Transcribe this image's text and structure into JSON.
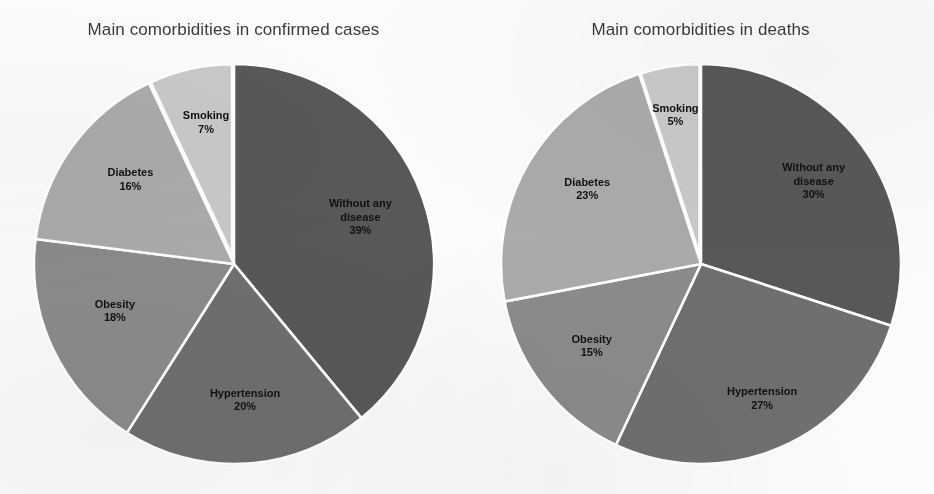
{
  "chart_data": [
    {
      "type": "pie",
      "title": "Main comorbidities in confirmed cases",
      "categories": [
        "Without any disease",
        "Hypertension",
        "Obesity",
        "Diabetes",
        "Smoking"
      ],
      "values": [
        39,
        20,
        18,
        16,
        7
      ],
      "value_labels": [
        "39%",
        "20%",
        "18%",
        "16%",
        "7%"
      ],
      "unit": "%",
      "start_angle_deg": 0,
      "direction": "clockwise",
      "exploded_slices": [
        "Smoking"
      ],
      "legend": "none",
      "labels_position": "inside-and-on-slice",
      "colors": [
        "#585858",
        "#6f6f6f",
        "#8b8b8b",
        "#ababab",
        "#c9c9c9"
      ],
      "slice_separator_color": "#ffffff"
    },
    {
      "type": "pie",
      "title": "Main comorbidities in deaths",
      "categories": [
        "Without any disease",
        "Hypertension",
        "Obesity",
        "Diabetes",
        "Smoking"
      ],
      "values": [
        30,
        27,
        15,
        23,
        5
      ],
      "value_labels": [
        "30%",
        "27%",
        "15%",
        "23%",
        "5%"
      ],
      "unit": "%",
      "start_angle_deg": 0,
      "direction": "clockwise",
      "exploded_slices": [
        "Smoking"
      ],
      "legend": "none",
      "labels_position": "inside-and-on-slice",
      "colors": [
        "#585858",
        "#6f6f6f",
        "#8b8b8b",
        "#ababab",
        "#c9c9c9"
      ],
      "slice_separator_color": "#ffffff"
    }
  ],
  "panels": {
    "left": {
      "title": "Main comorbidities in confirmed cases",
      "slices": [
        {
          "name": "Without any disease",
          "value": 39,
          "value_label": "39%",
          "color": "#585858"
        },
        {
          "name": "Hypertension",
          "value": 20,
          "value_label": "20%",
          "color": "#6f6f6f"
        },
        {
          "name": "Obesity",
          "value": 18,
          "value_label": "18%",
          "color": "#8b8b8b"
        },
        {
          "name": "Diabetes",
          "value": 16,
          "value_label": "16%",
          "color": "#ababab"
        },
        {
          "name": "Smoking",
          "value": 7,
          "value_label": "7%",
          "color": "#c9c9c9"
        }
      ]
    },
    "right": {
      "title": "Main comorbidities in deaths",
      "slices": [
        {
          "name": "Without any disease",
          "value": 30,
          "value_label": "30%",
          "color": "#585858"
        },
        {
          "name": "Hypertension",
          "value": 27,
          "value_label": "27%",
          "color": "#6f6f6f"
        },
        {
          "name": "Obesity",
          "value": 15,
          "value_label": "15%",
          "color": "#8b8b8b"
        },
        {
          "name": "Diabetes",
          "value": 23,
          "value_label": "23%",
          "color": "#ababab"
        },
        {
          "name": "Smoking",
          "value": 5,
          "value_label": "5%",
          "color": "#c9c9c9"
        }
      ]
    }
  },
  "background_color": "#fbfbfa",
  "title_color": "#3b3b3b",
  "label_color": "#111111"
}
